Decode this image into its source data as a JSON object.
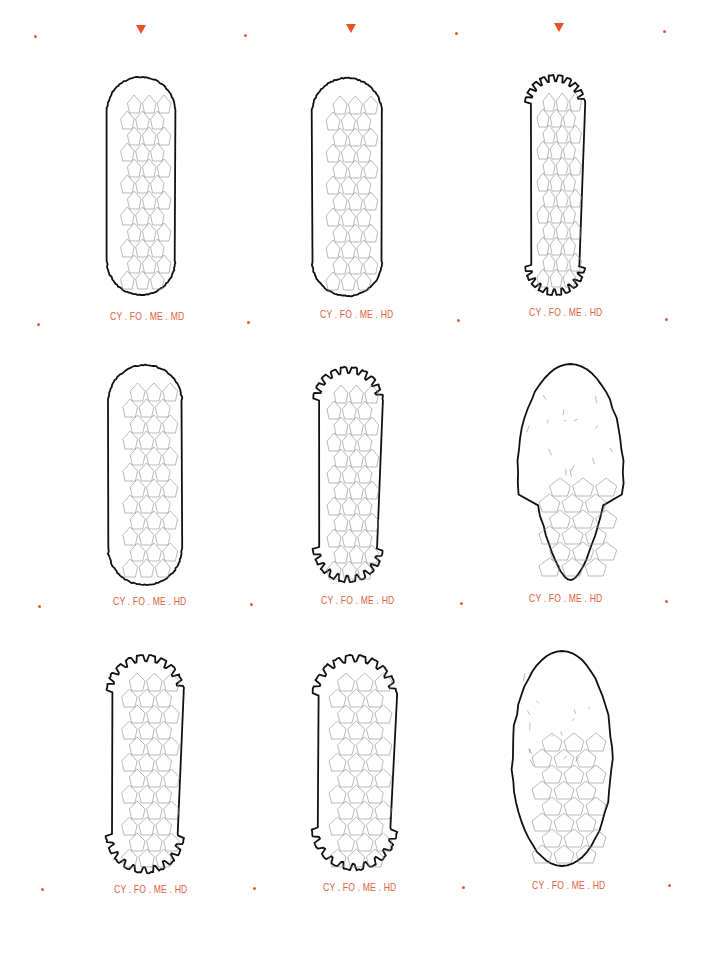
{
  "colors": {
    "accent": "#e8542a",
    "label": "#e0603f",
    "outline": "#111111",
    "scale_lines": "#8a8a8a"
  },
  "top_markers": [
    {
      "icon": "down-triangle-icon",
      "x": 141,
      "y": 29
    },
    {
      "icon": "down-triangle-icon",
      "x": 351,
      "y": 28
    },
    {
      "icon": "down-triangle-icon",
      "x": 559,
      "y": 27
    }
  ],
  "grid_dots": [
    {
      "x": 35,
      "y": 36
    },
    {
      "x": 245,
      "y": 35
    },
    {
      "x": 456,
      "y": 33
    },
    {
      "x": 664,
      "y": 31
    },
    {
      "x": 38,
      "y": 324
    },
    {
      "x": 248,
      "y": 322
    },
    {
      "x": 458,
      "y": 320
    },
    {
      "x": 666,
      "y": 319
    },
    {
      "x": 39,
      "y": 606
    },
    {
      "x": 251,
      "y": 604
    },
    {
      "x": 461,
      "y": 603
    },
    {
      "x": 666,
      "y": 601
    },
    {
      "x": 42,
      "y": 889
    },
    {
      "x": 254,
      "y": 888
    },
    {
      "x": 463,
      "y": 887
    },
    {
      "x": 669,
      "y": 885
    }
  ],
  "specimens": [
    {
      "label": "CY . FO . ME . MD",
      "type": "cylindrical-scaled",
      "x": 107,
      "y": 77,
      "w": 68,
      "h": 218,
      "label_x": 110,
      "label_y": 316
    },
    {
      "label": "CY . FO . ME . HD",
      "type": "cylindrical-scaled",
      "x": 312,
      "y": 78,
      "w": 70,
      "h": 218,
      "label_x": 320,
      "label_y": 314
    },
    {
      "label": "CY . FO . ME . HD",
      "type": "cylindrical-toothed",
      "x": 525,
      "y": 75,
      "w": 60,
      "h": 220,
      "label_x": 529,
      "label_y": 312
    },
    {
      "label": "CY . FO . ME . HD",
      "type": "cylindrical-scaled",
      "x": 108,
      "y": 365,
      "w": 74,
      "h": 220,
      "label_x": 113,
      "label_y": 601
    },
    {
      "label": "CY . FO . ME . HD",
      "type": "cylindrical-toothed",
      "x": 313,
      "y": 367,
      "w": 70,
      "h": 215,
      "label_x": 321,
      "label_y": 600
    },
    {
      "label": "CY . FO . ME . HD",
      "type": "bulbous-partial",
      "x": 518,
      "y": 364,
      "w": 105,
      "h": 216,
      "label_x": 529,
      "label_y": 598
    },
    {
      "label": "CY . FO . ME . HD",
      "type": "cylindrical-toothed",
      "x": 106,
      "y": 655,
      "w": 78,
      "h": 218,
      "label_x": 114,
      "label_y": 889
    },
    {
      "label": "CY . FO . ME . HD",
      "type": "cylindrical-toothed",
      "x": 312,
      "y": 655,
      "w": 85,
      "h": 215,
      "label_x": 323,
      "label_y": 887
    },
    {
      "label": "CY . FO . ME . HD",
      "type": "ovoid-partial",
      "x": 512,
      "y": 651,
      "w": 100,
      "h": 215,
      "label_x": 532,
      "label_y": 885
    }
  ]
}
